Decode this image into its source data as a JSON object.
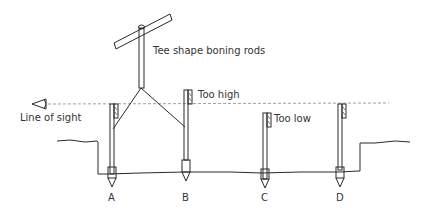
{
  "diagram": {
    "labels": {
      "tee": "Tee shape boning rods",
      "line_of_sight": "Line of sight",
      "too_high": "Too high",
      "too_low": "Too low"
    },
    "stakes": [
      {
        "id": "A",
        "label": "A"
      },
      {
        "id": "B",
        "label": "B"
      },
      {
        "id": "C",
        "label": "C"
      },
      {
        "id": "D",
        "label": "D"
      }
    ],
    "colors": {
      "line": "#2a2a2a",
      "sight_line": "#888888",
      "text": "#333333"
    }
  }
}
